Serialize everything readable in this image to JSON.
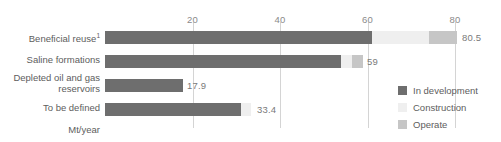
{
  "chart_data": {
    "type": "bar",
    "orientation": "horizontal",
    "stacked": true,
    "title": "",
    "xlabel": "Mt/year",
    "ylabel": "",
    "xlim": [
      0,
      80
    ],
    "xticks": [
      20,
      40,
      60,
      80
    ],
    "grid": true,
    "legend_position": "right",
    "categories": [
      "Beneficial reuse",
      "Saline formations",
      "Depleted oil and gas reservoirs",
      "To be defined"
    ],
    "category_footnotes": [
      "1",
      "",
      "",
      ""
    ],
    "series": [
      {
        "name": "In development",
        "color": "#6e6e6e",
        "values": [
          61.0,
          54.0,
          17.9,
          31.0
        ]
      },
      {
        "name": "Construction",
        "color": "#efefef",
        "values": [
          13.0,
          2.5,
          0,
          2.4
        ]
      },
      {
        "name": "Operate",
        "color": "#c6c6c6",
        "values": [
          6.5,
          2.5,
          0,
          0
        ]
      }
    ],
    "totals": [
      80.5,
      59,
      17.9,
      33.4
    ],
    "total_labels": [
      "80.5",
      "59",
      "17.9",
      "33.4"
    ]
  },
  "axis": {
    "unit_label": "Mt/year",
    "tick_labels": [
      "20",
      "40",
      "60",
      "80"
    ]
  },
  "legend": {
    "items": [
      {
        "label": "In development"
      },
      {
        "label": "Construction"
      },
      {
        "label": "Operate"
      }
    ]
  },
  "categories": [
    {
      "label": "Beneficial reuse",
      "footnote": "1"
    },
    {
      "label": "Saline formations",
      "footnote": ""
    },
    {
      "label": "Depleted oil and gas reservoirs",
      "footnote": ""
    },
    {
      "label": "To be defined",
      "footnote": ""
    }
  ],
  "values": {
    "bar0": "80.5",
    "bar1": "59",
    "bar2": "17.9",
    "bar3": "33.4"
  }
}
